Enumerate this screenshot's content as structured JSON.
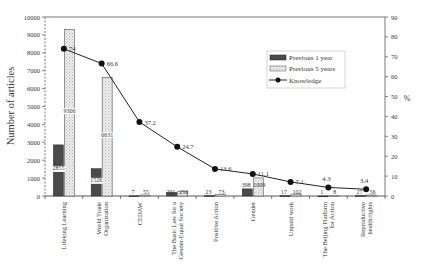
{
  "chart_data": {
    "type": "bar+line",
    "title": "",
    "categories": [
      "Lifelong Learning",
      "World Trade Organization",
      "CEDAW",
      "The Basic Law for a Gender-Equal Society",
      "Positive Action",
      "Gender",
      "Unpaid work",
      "The Beijing Platform for Action",
      "Reproductive health/rights"
    ],
    "category_lines": [
      [
        "Lifelong Learning"
      ],
      [
        "World Trade",
        "Organization"
      ],
      [
        "CEDAW"
      ],
      [
        "The Basic Law for a",
        "Gender-Equal Society"
      ],
      [
        "Positive Action"
      ],
      [
        "Gender"
      ],
      [
        "Unpaid work"
      ],
      [
        "The Beijing Platform",
        "for Action"
      ],
      [
        "Reproductive",
        "health/rights"
      ]
    ],
    "series": [
      {
        "name": "Previous 1 year",
        "type": "bar",
        "axis": "left",
        "color": "#555555",
        "values": [
          2855,
          1526,
          7,
          201,
          23,
          398,
          17,
          1,
          27
        ]
      },
      {
        "name": "Previous 5 years",
        "type": "bar",
        "axis": "left",
        "color": "#e6e6e6",
        "values": [
          9306,
          6631,
          55,
          250,
          73,
          1009,
          102,
          8,
          56
        ]
      },
      {
        "name": "Knowledge",
        "type": "line",
        "axis": "right",
        "color": "#111111",
        "values": [
          74,
          66.6,
          37.2,
          24.7,
          13.6,
          11.1,
          7.1,
          4.3,
          3.4
        ]
      }
    ],
    "ylabel": "Number of articles",
    "ylim": [
      0,
      10000
    ],
    "yticks": [
      0,
      1000,
      2000,
      3000,
      4000,
      5000,
      6000,
      7000,
      8000,
      9000,
      10000
    ],
    "y2label": "%",
    "y2lim": [
      0,
      90
    ],
    "y2ticks": [
      0,
      10,
      20,
      30,
      40,
      50,
      60,
      70,
      80,
      90
    ],
    "xlabel": "",
    "grid": false,
    "legend_position": "upper right (inside)"
  }
}
